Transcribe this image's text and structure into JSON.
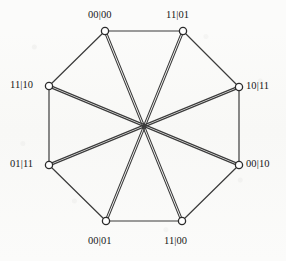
{
  "figure": {
    "kind": "graph-diagram",
    "shape": "octagon-with-diameters",
    "background_color": "#fbfbfa",
    "edge_color": "#3b3b3b",
    "node_stroke_color": "#2b2b2b",
    "node_fill_color": "#ffffff",
    "label_color": "#171717",
    "center": {
      "x": 144,
      "y": 126
    },
    "nodes": [
      {
        "id": "n0",
        "label": "00|00",
        "x": 105,
        "y": 31,
        "label_x": 88,
        "label_y": 10,
        "label_align": "left"
      },
      {
        "id": "n1",
        "label": "11|01",
        "x": 183,
        "y": 31,
        "label_x": 166,
        "label_y": 10,
        "label_align": "left"
      },
      {
        "id": "n2",
        "label": "10|11",
        "x": 239,
        "y": 87,
        "label_x": 246,
        "label_y": 81,
        "label_align": "left"
      },
      {
        "id": "n3",
        "label": "00|10",
        "x": 239,
        "y": 165,
        "label_x": 246,
        "label_y": 159,
        "label_align": "left"
      },
      {
        "id": "n4",
        "label": "11|00",
        "x": 182,
        "y": 221,
        "label_x": 164,
        "label_y": 236,
        "label_align": "left"
      },
      {
        "id": "n5",
        "label": "00|01",
        "x": 106,
        "y": 221,
        "label_x": 88,
        "label_y": 236,
        "label_align": "left"
      },
      {
        "id": "n6",
        "label": "01|11",
        "x": 49,
        "y": 165,
        "label_x": 10,
        "label_y": 159,
        "label_align": "left"
      },
      {
        "id": "n7",
        "label": "11|10",
        "x": 49,
        "y": 86,
        "label_x": 10,
        "label_y": 80,
        "label_align": "left"
      }
    ],
    "perimeter_edges": [
      {
        "from": "n0",
        "to": "n1"
      },
      {
        "from": "n1",
        "to": "n2"
      },
      {
        "from": "n2",
        "to": "n3"
      },
      {
        "from": "n3",
        "to": "n4"
      },
      {
        "from": "n4",
        "to": "n5"
      },
      {
        "from": "n5",
        "to": "n6"
      },
      {
        "from": "n6",
        "to": "n7"
      },
      {
        "from": "n7",
        "to": "n0"
      }
    ],
    "diagonal_edges": [
      {
        "from": "n0",
        "to": "n4"
      },
      {
        "from": "n1",
        "to": "n5"
      },
      {
        "from": "n2",
        "to": "n6"
      },
      {
        "from": "n3",
        "to": "n7"
      }
    ],
    "node_radius": 3.6,
    "perimeter_stroke_width": 1.2,
    "diagonal_stroke_width": 1.1,
    "diagonal_gap": 1.9
  }
}
